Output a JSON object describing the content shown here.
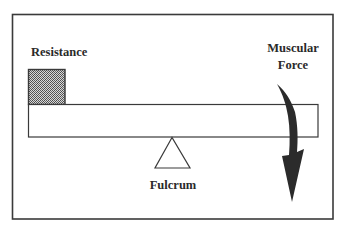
{
  "diagram": {
    "labels": {
      "resistance": "Resistance",
      "muscular_force_line1": "Muscular",
      "muscular_force_line2": "Force",
      "fulcrum": "Fulcrum"
    },
    "parts": [
      {
        "id": "resistance-load",
        "description": "Hatched square load resting on left end of lever",
        "fill": "stipple-gray"
      },
      {
        "id": "lever-beam",
        "description": "Horizontal rectangular lever bar"
      },
      {
        "id": "fulcrum",
        "description": "Triangular pivot beneath center of beam"
      },
      {
        "id": "muscular-force-arrow",
        "description": "Curved downward arrow on right end of beam"
      }
    ],
    "colors": {
      "stroke": "#3a3a3a",
      "arrow": "#2b2b2b",
      "hatch_dark": "#4a4a4a",
      "hatch_light": "#d8d8d8",
      "background": "#ffffff"
    }
  }
}
